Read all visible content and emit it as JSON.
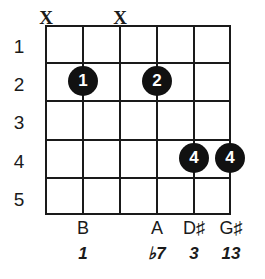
{
  "diagram": {
    "type": "guitar-chord-diagram",
    "colors": {
      "background": "#ffffff",
      "lines": "#1a1a1a",
      "dot_fill": "#111111",
      "dot_text": "#ffffff"
    },
    "grid": {
      "string_count": 6,
      "fret_count": 5
    },
    "fret_numbers": [
      "1",
      "2",
      "3",
      "4",
      "5"
    ],
    "mutes": [
      {
        "string": 1,
        "symbol": "X"
      },
      {
        "string": 3,
        "symbol": "X"
      }
    ],
    "dots": [
      {
        "string": 2,
        "fret": 2,
        "finger": "1"
      },
      {
        "string": 4,
        "fret": 2,
        "finger": "2"
      },
      {
        "string": 5,
        "fret": 4,
        "finger": "4"
      },
      {
        "string": 6,
        "fret": 4,
        "finger": "4"
      }
    ],
    "notes": [
      {
        "string": 1,
        "name": ""
      },
      {
        "string": 2,
        "name": "B"
      },
      {
        "string": 3,
        "name": ""
      },
      {
        "string": 4,
        "name": "A"
      },
      {
        "string": 5,
        "name": "D♯"
      },
      {
        "string": 6,
        "name": "G♯"
      }
    ],
    "intervals": [
      {
        "string": 1,
        "name": ""
      },
      {
        "string": 2,
        "name": "1"
      },
      {
        "string": 3,
        "name": ""
      },
      {
        "string": 4,
        "name": "♭7"
      },
      {
        "string": 5,
        "name": "3"
      },
      {
        "string": 6,
        "name": "13"
      }
    ]
  }
}
